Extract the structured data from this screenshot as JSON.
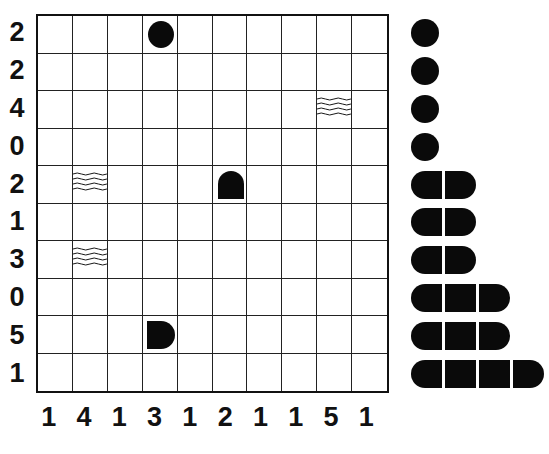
{
  "puzzle": {
    "type": "battleship",
    "size": 10,
    "row_clues": [
      "2",
      "2",
      "4",
      "0",
      "2",
      "1",
      "3",
      "0",
      "5",
      "1"
    ],
    "col_clues": [
      "1",
      "4",
      "1",
      "3",
      "1",
      "2",
      "1",
      "1",
      "5",
      "1"
    ],
    "given_cells": [
      {
        "row": 0,
        "col": 3,
        "kind": "submarine"
      },
      {
        "row": 2,
        "col": 8,
        "kind": "water"
      },
      {
        "row": 4,
        "col": 1,
        "kind": "water"
      },
      {
        "row": 4,
        "col": 5,
        "kind": "ship-end-bottom"
      },
      {
        "row": 6,
        "col": 1,
        "kind": "water"
      },
      {
        "row": 8,
        "col": 3,
        "kind": "ship-end-left"
      }
    ]
  },
  "fleet": [
    {
      "length": 1,
      "count": 4
    },
    {
      "length": 2,
      "count": 3
    },
    {
      "length": 3,
      "count": 2
    },
    {
      "length": 4,
      "count": 1
    }
  ],
  "colors": {
    "ink": "#0a0a0a",
    "grid": "#222222",
    "background": "#ffffff"
  }
}
